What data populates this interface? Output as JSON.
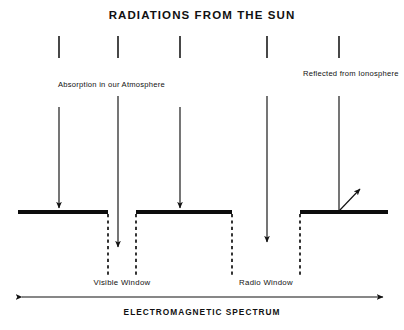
{
  "figure": {
    "title": "RADIATIONS FROM THE SUN",
    "axis_label": "ELECTROMAGNETIC SPECTRUM",
    "annotations": {
      "left": "Absorption in our Atmosphere",
      "right": "Reflected from Ionosphere"
    },
    "windows": [
      {
        "name": "visible-window",
        "label": "Visible Window",
        "center_x": 118
      },
      {
        "name": "radio-window",
        "label": "Radio Window",
        "center_x": 267
      }
    ],
    "colors": {
      "ink": "#111111",
      "barrier": "#0d0d0d",
      "background": "#ffffff"
    },
    "rays": [
      {
        "name": "ray-absorbed-1",
        "x": 59,
        "tick_top": 36,
        "tick_bottom": 58,
        "line_top": 107,
        "outcome": "absorbed",
        "end_y": 212
      },
      {
        "name": "ray-visible-window",
        "x": 118,
        "tick_top": 36,
        "tick_bottom": 58,
        "line_top": 96,
        "outcome": "transmitted",
        "end_y": 251
      },
      {
        "name": "ray-absorbed-2",
        "x": 180,
        "tick_top": 36,
        "tick_bottom": 58,
        "line_top": 107,
        "outcome": "absorbed",
        "end_y": 212
      },
      {
        "name": "ray-radio-window",
        "x": 267,
        "tick_top": 36,
        "tick_bottom": 58,
        "line_top": 96,
        "outcome": "transmitted",
        "end_y": 246
      },
      {
        "name": "ray-reflected",
        "x": 339,
        "tick_top": 36,
        "tick_bottom": 58,
        "line_top": 96,
        "outcome": "reflected",
        "end_y": 212,
        "reflect_to_x": 362,
        "reflect_to_y": 186
      }
    ],
    "barriers": [
      {
        "name": "barrier-segment-left",
        "x1": 18,
        "x2": 108,
        "y": 212
      },
      {
        "name": "barrier-segment-middle",
        "x1": 136,
        "x2": 232,
        "y": 212
      },
      {
        "name": "barrier-segment-right",
        "x1": 300,
        "x2": 388,
        "y": 212
      }
    ],
    "window_edges": [
      {
        "name": "window-edge-visible-left",
        "x": 108,
        "y1": 213,
        "y2": 276
      },
      {
        "name": "window-edge-visible-right",
        "x": 136,
        "y1": 213,
        "y2": 276
      },
      {
        "name": "window-edge-radio-left",
        "x": 232,
        "y1": 213,
        "y2": 276
      },
      {
        "name": "window-edge-radio-right",
        "x": 300,
        "y1": 213,
        "y2": 276
      }
    ],
    "spectrum_axis": {
      "x1": 20,
      "x2": 385,
      "y": 297
    }
  }
}
